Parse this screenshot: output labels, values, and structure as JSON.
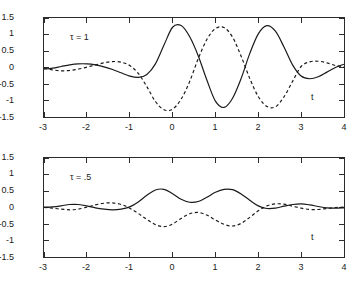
{
  "figure": {
    "background": "#ffffff",
    "axis_color": "#2b2b2b",
    "curve_color": "#1a1a1a"
  },
  "chart_data": [
    {
      "type": "line",
      "panel": "top",
      "title": "",
      "annotation": "τ = 1",
      "xlabel": "t",
      "ylabel": "",
      "xlim": [
        -3,
        4
      ],
      "ylim": [
        -1.5,
        1.5
      ],
      "xticks": [
        -3,
        -2,
        -1,
        0,
        1,
        2,
        3,
        4
      ],
      "xticklabels": [
        "-3",
        "-2",
        "-1",
        "0",
        "1",
        "2",
        "3",
        "4"
      ],
      "yticks": [
        -1.5,
        -1,
        -0.5,
        0,
        0.5,
        1,
        1.5
      ],
      "yticklabels": [
        "-1.5",
        "-1",
        "-0.5",
        "0",
        "0.5",
        "1",
        "1.5"
      ],
      "grid": false,
      "legend": "none",
      "series": [
        {
          "name": "solid",
          "style": "solid",
          "x": [
            -3.0,
            -2.8,
            -2.6,
            -2.4,
            -2.2,
            -2.0,
            -1.8,
            -1.6,
            -1.4,
            -1.2,
            -1.0,
            -0.8,
            -0.6,
            -0.4,
            -0.2,
            0.0,
            0.2,
            0.4,
            0.6,
            0.8,
            1.0,
            1.2,
            1.4,
            1.6,
            1.8,
            2.0,
            2.2,
            2.4,
            2.6,
            2.8,
            3.0,
            3.2,
            3.4,
            3.6,
            3.8,
            4.0
          ],
          "values": [
            -0.05,
            -0.02,
            0.03,
            0.08,
            0.11,
            0.11,
            0.08,
            0.02,
            -0.06,
            -0.16,
            -0.26,
            -0.3,
            -0.21,
            0.11,
            0.68,
            1.22,
            1.27,
            0.93,
            0.35,
            -0.38,
            -1.02,
            -1.21,
            -0.93,
            -0.33,
            0.42,
            1.02,
            1.27,
            1.1,
            0.62,
            0.08,
            -0.26,
            -0.34,
            -0.28,
            -0.14,
            0.0,
            0.1
          ]
        },
        {
          "name": "dashed",
          "style": "dashed",
          "x": [
            -3.0,
            -2.8,
            -2.6,
            -2.4,
            -2.2,
            -2.0,
            -1.8,
            -1.6,
            -1.4,
            -1.2,
            -1.0,
            -0.8,
            -0.6,
            -0.4,
            -0.2,
            0.0,
            0.2,
            0.4,
            0.6,
            0.8,
            1.0,
            1.2,
            1.4,
            1.6,
            1.8,
            2.0,
            2.2,
            2.4,
            2.6,
            2.8,
            3.0,
            3.2,
            3.4,
            3.6,
            3.8,
            4.0
          ],
          "values": [
            -0.02,
            -0.07,
            -0.1,
            -0.09,
            -0.05,
            0.01,
            0.08,
            0.14,
            0.18,
            0.16,
            0.06,
            -0.18,
            -0.58,
            -1.03,
            -1.28,
            -1.26,
            -0.96,
            -0.42,
            0.27,
            0.85,
            1.18,
            1.21,
            0.92,
            0.34,
            -0.33,
            -0.88,
            -1.18,
            -1.19,
            -0.89,
            -0.42,
            0.03,
            0.17,
            0.19,
            0.14,
            0.06,
            0.02
          ]
        }
      ]
    },
    {
      "type": "line",
      "panel": "bottom",
      "title": "",
      "annotation": "τ = .5",
      "xlabel": "t",
      "ylabel": "",
      "xlim": [
        -3,
        4
      ],
      "ylim": [
        -1.5,
        1.5
      ],
      "xticks": [
        -3,
        -2,
        -1,
        0,
        1,
        2,
        3,
        4
      ],
      "xticklabels": [
        "-3",
        "-2",
        "-1",
        "0",
        "1",
        "2",
        "3",
        "4"
      ],
      "yticks": [
        -1.5,
        -1,
        -0.5,
        0,
        0.5,
        1,
        1.5
      ],
      "yticklabels": [
        "-1.5",
        "-1",
        "-0.5",
        "0",
        "0.5",
        "1",
        "1.5"
      ],
      "grid": false,
      "legend": "none",
      "series": [
        {
          "name": "solid",
          "style": "solid",
          "x": [
            -3.0,
            -2.8,
            -2.6,
            -2.4,
            -2.2,
            -2.0,
            -1.8,
            -1.6,
            -1.4,
            -1.2,
            -1.0,
            -0.8,
            -0.6,
            -0.4,
            -0.2,
            0.0,
            0.2,
            0.4,
            0.6,
            0.8,
            1.0,
            1.2,
            1.4,
            1.6,
            1.8,
            2.0,
            2.2,
            2.4,
            2.6,
            2.8,
            3.0,
            3.2,
            3.4,
            3.6,
            3.8,
            4.0
          ],
          "values": [
            0.01,
            0.02,
            0.05,
            0.09,
            0.09,
            0.05,
            -0.01,
            -0.05,
            -0.07,
            -0.05,
            0.02,
            0.17,
            0.37,
            0.53,
            0.55,
            0.42,
            0.25,
            0.16,
            0.18,
            0.31,
            0.46,
            0.55,
            0.54,
            0.41,
            0.22,
            0.05,
            -0.03,
            -0.02,
            0.04,
            0.09,
            0.11,
            0.08,
            0.03,
            -0.01,
            -0.02,
            -0.01
          ]
        },
        {
          "name": "dashed",
          "style": "dashed",
          "x": [
            -3.0,
            -2.8,
            -2.6,
            -2.4,
            -2.2,
            -2.0,
            -1.8,
            -1.6,
            -1.4,
            -1.2,
            -1.0,
            -0.8,
            -0.6,
            -0.4,
            -0.2,
            0.0,
            0.2,
            0.4,
            0.6,
            0.8,
            1.0,
            1.2,
            1.4,
            1.6,
            1.8,
            2.0,
            2.2,
            2.4,
            2.6,
            2.8,
            3.0,
            3.2,
            3.4,
            3.6,
            3.8,
            4.0
          ],
          "values": [
            0.0,
            -0.02,
            -0.05,
            -0.07,
            -0.05,
            0.01,
            0.08,
            0.13,
            0.14,
            0.09,
            -0.02,
            -0.18,
            -0.36,
            -0.52,
            -0.58,
            -0.5,
            -0.33,
            -0.19,
            -0.15,
            -0.23,
            -0.38,
            -0.51,
            -0.56,
            -0.48,
            -0.3,
            -0.1,
            0.05,
            0.11,
            0.1,
            0.04,
            -0.02,
            -0.06,
            -0.06,
            -0.03,
            0.0,
            0.01
          ]
        }
      ]
    }
  ]
}
